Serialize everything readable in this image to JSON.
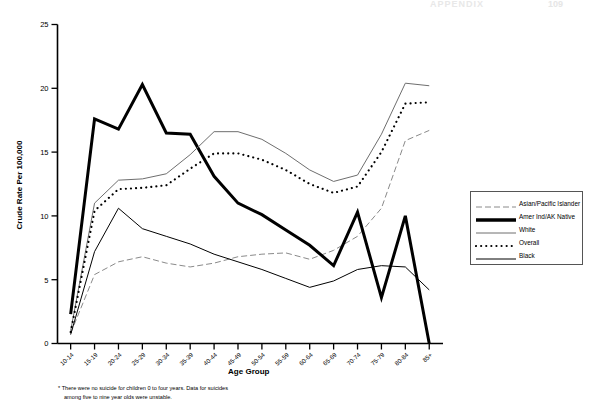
{
  "header": {
    "appendix_label": "APPENDIX",
    "page_number": "109"
  },
  "footnote": {
    "line1": "* There were no suicide for children 0 to four years. Data for suicides",
    "line2": "among five to nine year olds were unstable."
  },
  "legend": {
    "position": "right",
    "items": [
      {
        "label": "Asian/Pacific Islander",
        "style": "dashed",
        "color": "#8a8a8a"
      },
      {
        "label": "Amer Ind/AK Native",
        "style": "thick-solid",
        "color": "#000000"
      },
      {
        "label": "White",
        "style": "thin-solid",
        "color": "#6e6e6e"
      },
      {
        "label": "Overall",
        "style": "dotted",
        "color": "#000000"
      },
      {
        "label": "Black",
        "style": "thin-solid",
        "color": "#000000"
      }
    ]
  },
  "chart_data": {
    "type": "line",
    "title": "",
    "xlabel": "Age Group",
    "ylabel": "Crude Rate Per 100,000",
    "ylim": [
      0,
      25
    ],
    "yticks": [
      0,
      5,
      10,
      15,
      20,
      25
    ],
    "grid": false,
    "legend_position": "right",
    "categories": [
      "10-14",
      "15-19",
      "20-24",
      "25-29",
      "30-34",
      "35-39",
      "40-44",
      "45-49",
      "50-54",
      "55-59",
      "60-64",
      "65-69",
      "70-74",
      "75-79",
      "80-84",
      "85+"
    ],
    "series": [
      {
        "name": "Asian/Pacific Islander",
        "style": "dashed",
        "color": "#8a8a8a",
        "values": [
          0.8,
          5.4,
          6.4,
          6.8,
          6.3,
          6.0,
          6.3,
          6.8,
          7.0,
          7.1,
          6.6,
          7.3,
          8.4,
          10.6,
          15.9,
          16.7
        ]
      },
      {
        "name": "Amer Ind/AK Native",
        "style": "thick-solid",
        "color": "#000000",
        "values": [
          2.3,
          17.6,
          16.8,
          20.3,
          16.5,
          16.4,
          13.1,
          11.0,
          10.1,
          8.9,
          7.7,
          6.1,
          10.3,
          3.6,
          10.0,
          0.0
        ]
      },
      {
        "name": "White",
        "style": "thin-solid",
        "color": "#6e6e6e",
        "values": [
          1.0,
          11.0,
          12.8,
          12.9,
          13.3,
          14.8,
          16.6,
          16.6,
          16.0,
          14.9,
          13.6,
          12.7,
          13.2,
          16.4,
          20.4,
          20.2
        ]
      },
      {
        "name": "Overall",
        "style": "dotted",
        "color": "#000000",
        "values": [
          0.9,
          10.4,
          12.1,
          12.2,
          12.4,
          13.7,
          14.9,
          14.9,
          14.4,
          13.6,
          12.5,
          11.8,
          12.3,
          15.0,
          18.8,
          18.9
        ]
      },
      {
        "name": "Black",
        "style": "thin-solid",
        "color": "#000000",
        "values": [
          0.7,
          7.2,
          10.6,
          9.0,
          8.4,
          7.8,
          7.0,
          6.4,
          5.8,
          5.1,
          4.4,
          4.9,
          5.8,
          6.1,
          6.0,
          4.2
        ]
      }
    ]
  }
}
